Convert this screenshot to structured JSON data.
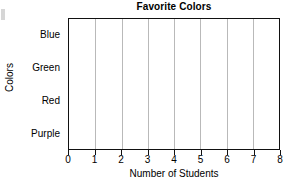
{
  "chart_data": {
    "type": "bar",
    "orientation": "horizontal",
    "title": "Favorite Colors",
    "xlabel": "Number of Students",
    "ylabel": "Colors",
    "categories": [
      "Blue",
      "Green",
      "Red",
      "Purple"
    ],
    "values": [
      6,
      2,
      8,
      5
    ],
    "xlim": [
      0,
      8
    ],
    "xticks": [
      0,
      1,
      2,
      3,
      4,
      5,
      6,
      7,
      8
    ],
    "xtick_labels": [
      "0",
      "1",
      "2",
      "3",
      "4",
      "5",
      "6",
      "7",
      "8"
    ],
    "grid": "vertical",
    "legend": "none",
    "bar_color": "#000000",
    "gridline_color": "#b9b9b9",
    "frame_color": "#111111",
    "background": "#ffffff"
  }
}
